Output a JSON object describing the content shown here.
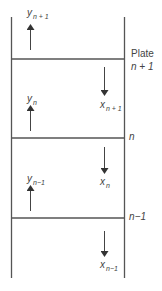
{
  "diagram": {
    "type": "column-plate-schematic",
    "plates": [
      {
        "label_top": "Plate",
        "label": "n + 1",
        "y": 59
      },
      {
        "label": "n",
        "y": 138
      },
      {
        "label": "n−1",
        "y": 218
      }
    ],
    "vapor_streams": [
      {
        "var": "y",
        "sub": "n + 1",
        "direction": "up"
      },
      {
        "var": "y",
        "sub": "n",
        "direction": "up"
      },
      {
        "var": "y",
        "sub": "n−1",
        "direction": "up"
      }
    ],
    "liquid_streams": [
      {
        "var": "x",
        "sub": "n + 1",
        "direction": "down"
      },
      {
        "var": "x",
        "sub": "n",
        "direction": "down"
      },
      {
        "var": "x",
        "sub": "n−1",
        "direction": "down"
      }
    ],
    "colors": {
      "line": "#555555",
      "text": "#444444"
    }
  }
}
